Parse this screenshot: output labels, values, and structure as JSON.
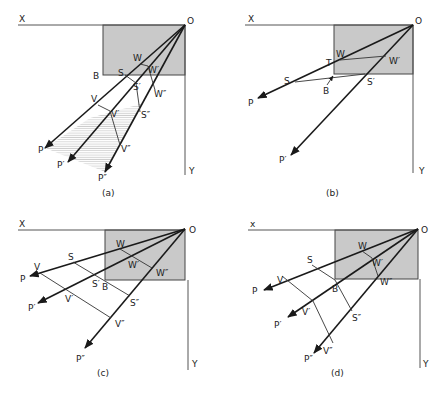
{
  "figure": {
    "panels": [
      {
        "id": "a",
        "caption": "(a)",
        "axis_labels": {
          "x": "X",
          "y": "Y",
          "origin": "O"
        },
        "point_labels": {
          "B": "B",
          "W": "W",
          "W1": "W′",
          "W2": "W″",
          "S": "S",
          "S1": "S′",
          "S2": "S″",
          "V": "V",
          "V1": "V′",
          "V2": "V″",
          "P": "P",
          "P1": "P′",
          "P2": "P″"
        },
        "shaded_region": "hatched fan between rays OP and OP″"
      },
      {
        "id": "b",
        "caption": "(b)",
        "axis_labels": {
          "x": "X",
          "y": "Y",
          "origin": "O"
        },
        "point_labels": {
          "T": "T",
          "W": "W",
          "W1": "W′",
          "S": "S",
          "S1": "S′",
          "B": "B",
          "P": "P",
          "P1": "P′"
        }
      },
      {
        "id": "c",
        "caption": "(c)",
        "axis_labels": {
          "x": "X",
          "y": "Y",
          "origin": "O"
        },
        "point_labels": {
          "W": "W",
          "W1": "W′",
          "W2": "W″",
          "S": "S",
          "S1": "S′",
          "S2": "S″",
          "B": "B",
          "V": "V",
          "V1": "V′",
          "V2": "V″",
          "P": "P",
          "P1": "P′",
          "P2": "P″"
        }
      },
      {
        "id": "d",
        "caption": "(d)",
        "axis_labels": {
          "x": "x",
          "y": "Y",
          "origin": "O"
        },
        "point_labels": {
          "W": "W",
          "W1": "W′",
          "W2": "W″",
          "S": "S",
          "S2": "S″",
          "B": "B",
          "V": "V",
          "V1": "V′",
          "V2": "V″",
          "P": "P",
          "P1": "P′",
          "P2": "P″"
        }
      }
    ]
  }
}
